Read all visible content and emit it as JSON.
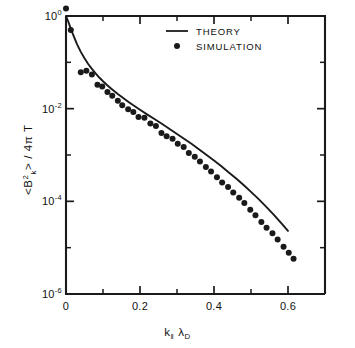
{
  "figure": {
    "title": "",
    "background": "#ffffff",
    "ink": "#1a1a1a"
  },
  "axes": {
    "x": {
      "label_html": "k<sub>‖</sub> λ<sub>D</sub>",
      "label_plain": "k_|| lambda_D",
      "ticks": [
        "0",
        "0.2",
        "0.4",
        "0.6"
      ],
      "tick_values": [
        0,
        0.2,
        0.4,
        0.6
      ],
      "minor_tick_values": [
        0.1,
        0.3,
        0.5,
        0.7
      ],
      "range": [
        0,
        0.7
      ]
    },
    "y": {
      "label_plain": "<B_k^2> / 4 pi T",
      "ticks": [
        "10^0",
        "10^-2",
        "10^-4",
        "10^-6"
      ],
      "tick_exponents": [
        0,
        -2,
        -4,
        -6
      ],
      "minor_tick_exponents": [
        -1,
        -3,
        -5
      ],
      "range_exponents": [
        -6,
        0
      ],
      "scale": "log"
    }
  },
  "legend": {
    "position": "top-center",
    "entries": [
      {
        "label": "THEORY",
        "marker": "line"
      },
      {
        "label": "SIMULATION",
        "marker": "dot"
      }
    ]
  },
  "chart_data": {
    "type": "scatter",
    "title": "",
    "xlabel": "k_|| lambda_D",
    "ylabel": "<B_k^2> / 4 pi T",
    "yscale": "log",
    "xlim": [
      0,
      0.7
    ],
    "ylim": [
      1e-06,
      10
    ],
    "grid": false,
    "legend_position": "top-center",
    "series": [
      {
        "name": "THEORY",
        "type": "line",
        "x": [
          0.0,
          0.005,
          0.01,
          0.015,
          0.02,
          0.03,
          0.04,
          0.05,
          0.06,
          0.07,
          0.08,
          0.09,
          0.1,
          0.11,
          0.12,
          0.13,
          0.14,
          0.15,
          0.16,
          0.17,
          0.18,
          0.19,
          0.2,
          0.22,
          0.24,
          0.26,
          0.28,
          0.3,
          0.32,
          0.34,
          0.36,
          0.38,
          0.4,
          0.42,
          0.44,
          0.46,
          0.48,
          0.5,
          0.52,
          0.54,
          0.56,
          0.58,
          0.6
        ],
        "y": [
          1.0,
          0.8,
          0.62,
          0.48,
          0.38,
          0.245,
          0.168,
          0.122,
          0.092,
          0.072,
          0.0575,
          0.047,
          0.039,
          0.0328,
          0.028,
          0.024,
          0.0207,
          0.018,
          0.0157,
          0.0138,
          0.0121,
          0.0107,
          0.00945,
          0.00745,
          0.0059,
          0.00465,
          0.00365,
          0.00285,
          0.00222,
          0.00172,
          0.00132,
          0.001,
          0.00076,
          0.00057,
          0.00042,
          0.00031,
          0.000225,
          0.00016,
          0.000113,
          7.8e-05,
          5.3e-05,
          3.5e-05,
          2.3e-05
        ]
      },
      {
        "name": "SIMULATION",
        "type": "scatter",
        "x": [
          0.0,
          0.013,
          0.04,
          0.055,
          0.07,
          0.085,
          0.098,
          0.112,
          0.125,
          0.14,
          0.152,
          0.168,
          0.182,
          0.196,
          0.212,
          0.228,
          0.243,
          0.258,
          0.272,
          0.288,
          0.302,
          0.318,
          0.332,
          0.348,
          0.362,
          0.378,
          0.392,
          0.408,
          0.422,
          0.438,
          0.452,
          0.468,
          0.482,
          0.498,
          0.512,
          0.528,
          0.542,
          0.558,
          0.572,
          0.588,
          0.602,
          0.615
        ],
        "y": [
          1.45,
          0.5,
          0.061,
          0.066,
          0.0545,
          0.033,
          0.03,
          0.023,
          0.019,
          0.0148,
          0.0118,
          0.0097,
          0.0085,
          0.0066,
          0.0064,
          0.0048,
          0.0042,
          0.003,
          0.00255,
          0.00225,
          0.00175,
          0.00148,
          0.0011,
          0.00092,
          0.00072,
          0.00055,
          0.00044,
          0.00033,
          0.000255,
          0.000205,
          0.000155,
          0.00012,
          9.2e-05,
          6.6e-05,
          5e-05,
          3.6e-05,
          2.7e-05,
          2.05e-05,
          1.5e-05,
          1.05e-05,
          7.8e-06,
          5.8e-06
        ]
      }
    ]
  }
}
